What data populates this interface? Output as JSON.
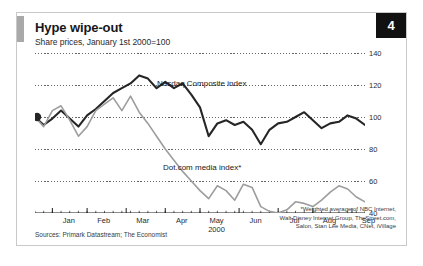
{
  "figure": {
    "badge_number": "4",
    "title": "Hype wipe-out",
    "subtitle": "Share prices, January 1st 2000=100",
    "source": "Sources: Primark Datastream; The Economist",
    "footnote_line1": "*Weighted average of NBC Internet,",
    "footnote_line2": "Walt Disney Internet Group, TheStreet.com,",
    "footnote_line3": "Salon, Stan Lee Media, CNet, iVillage"
  },
  "colors": {
    "nasdaq": "#262626",
    "dotcom": "#9d9d9d",
    "grid": "#555555",
    "axis": "#1a1a1a",
    "badge_bg": "#111111",
    "frame": "#c9c9c9"
  },
  "chart_data": {
    "type": "line",
    "title": "Hype wipe-out",
    "subtitle": "Share prices, January 1st 2000=100",
    "xlabel": "2000",
    "ylabel": "",
    "ylim": [
      40,
      140
    ],
    "yticks": [
      40,
      60,
      80,
      100,
      120,
      140
    ],
    "ytick_labels": [
      "40",
      "60",
      "80",
      "100",
      "120",
      "140"
    ],
    "grid": true,
    "grid_style": "dotted-horizontal",
    "legend": "inline-annotations",
    "xtick_labels": [
      "Jan",
      "Feb",
      "Mar",
      "Apr",
      "May",
      "Jun",
      "Jul",
      "Aug",
      "Sep"
    ],
    "xtick_sublabel": "2000",
    "x_range_weeks": [
      0,
      38
    ],
    "annotations": [
      {
        "text": "Nasdaq Composite index",
        "series": "Nasdaq Composite index"
      },
      {
        "text": "Dot.com media index*",
        "series": "Dot.com media index*"
      }
    ],
    "start_marker": {
      "series": "Nasdaq Composite index",
      "x": 0,
      "y": 100,
      "shape": "filled-circle"
    },
    "series": [
      {
        "name": "Nasdaq Composite index",
        "color": "#262626",
        "x": [
          0,
          1,
          2,
          3,
          4,
          5,
          6,
          7,
          8,
          9,
          10,
          11,
          12,
          13,
          14,
          15,
          16,
          17,
          18,
          19,
          20,
          21,
          22,
          23,
          24,
          25,
          26,
          27,
          28,
          29,
          30,
          31,
          32,
          33,
          34,
          35,
          36,
          37,
          38
        ],
        "values": [
          100,
          95,
          99,
          104,
          99,
          94,
          101,
          105,
          110,
          115,
          118,
          121,
          126,
          124,
          118,
          122,
          118,
          121,
          114,
          106,
          88,
          96,
          98,
          95,
          97,
          92,
          83,
          92,
          96,
          97,
          100,
          103,
          98,
          93,
          96,
          97,
          101,
          99,
          95
        ]
      },
      {
        "name": "Dot.com media index*",
        "color": "#9d9d9d",
        "x": [
          0,
          1,
          2,
          3,
          4,
          5,
          6,
          7,
          8,
          9,
          10,
          11,
          12,
          13,
          14,
          15,
          16,
          17,
          18,
          19,
          20,
          21,
          22,
          23,
          24,
          25,
          26,
          27,
          28,
          29,
          30,
          31,
          32,
          33,
          34,
          35,
          36,
          37,
          38
        ],
        "values": [
          100,
          94,
          104,
          107,
          98,
          88,
          94,
          104,
          108,
          112,
          104,
          113,
          103,
          96,
          88,
          80,
          73,
          66,
          60,
          54,
          49,
          57,
          54,
          48,
          58,
          56,
          44,
          41,
          40,
          42,
          47,
          46,
          44,
          48,
          53,
          57,
          55,
          50,
          47
        ]
      }
    ]
  }
}
